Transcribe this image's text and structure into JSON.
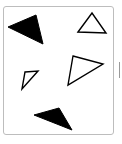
{
  "figure": {
    "frame": {
      "border_color": "#bdbdbd"
    },
    "side_tick": {
      "color": "#9a9a9a"
    },
    "shapes": [
      {
        "name": "filled-triangle-top-left",
        "type": "triangle",
        "fill": "#000000",
        "stroke": "#000000",
        "points": "8,27 36,15 43,44"
      },
      {
        "name": "outline-triangle-top-right",
        "type": "triangle",
        "fill": "none",
        "stroke": "#000000",
        "points": "78,32 92,13 106,33"
      },
      {
        "name": "outline-triangle-middle-right",
        "type": "triangle",
        "fill": "none",
        "stroke": "#000000",
        "points": "73,56 103,64 68,85"
      },
      {
        "name": "outline-triangle-small-left",
        "type": "triangle",
        "fill": "none",
        "stroke": "#000000",
        "points": "25,72 38,71 22,89"
      },
      {
        "name": "filled-triangle-bottom",
        "type": "triangle",
        "fill": "#000000",
        "stroke": "#000000",
        "points": "34,115 59,108 72,130"
      }
    ]
  }
}
